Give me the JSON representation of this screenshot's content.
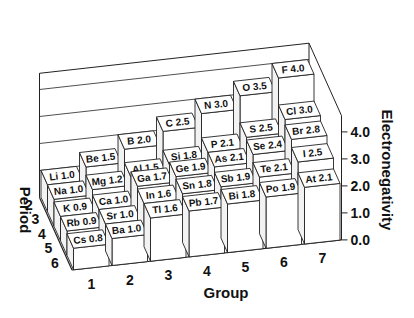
{
  "chart_data": {
    "type": "bar3d",
    "title": "",
    "xlabel": "Group",
    "ylabel": "Period",
    "zlabel": "Electronegativity",
    "x_categories": [
      "1",
      "2",
      "3",
      "4",
      "5",
      "6",
      "7"
    ],
    "y_categories": [
      "2",
      "3",
      "4",
      "5",
      "6"
    ],
    "z_ticks": [
      "0.0",
      "1.0",
      "2.0",
      "3.0",
      "4.0"
    ],
    "zlim": [
      0,
      4.0
    ],
    "grid": true,
    "elements": [
      {
        "symbol": "Li",
        "group": 1,
        "period": 2,
        "value": 1.0
      },
      {
        "symbol": "Na",
        "group": 1,
        "period": 3,
        "value": 1.0
      },
      {
        "symbol": "K",
        "group": 1,
        "period": 4,
        "value": 0.9
      },
      {
        "symbol": "Rb",
        "group": 1,
        "period": 5,
        "value": 0.9
      },
      {
        "symbol": "Cs",
        "group": 1,
        "period": 6,
        "value": 0.8
      },
      {
        "symbol": "Be",
        "group": 2,
        "period": 2,
        "value": 1.5
      },
      {
        "symbol": "Mg",
        "group": 2,
        "period": 3,
        "value": 1.2
      },
      {
        "symbol": "Ca",
        "group": 2,
        "period": 4,
        "value": 1.0
      },
      {
        "symbol": "Sr",
        "group": 2,
        "period": 5,
        "value": 1.0
      },
      {
        "symbol": "Ba",
        "group": 2,
        "period": 6,
        "value": 1.0
      },
      {
        "symbol": "B",
        "group": 3,
        "period": 2,
        "value": 2.0
      },
      {
        "symbol": "Al",
        "group": 3,
        "period": 3,
        "value": 1.5
      },
      {
        "symbol": "Ga",
        "group": 3,
        "period": 4,
        "value": 1.7
      },
      {
        "symbol": "In",
        "group": 3,
        "period": 5,
        "value": 1.6
      },
      {
        "symbol": "Tl",
        "group": 3,
        "period": 6,
        "value": 1.6
      },
      {
        "symbol": "C",
        "group": 4,
        "period": 2,
        "value": 2.5
      },
      {
        "symbol": "Si",
        "group": 4,
        "period": 3,
        "value": 1.8
      },
      {
        "symbol": "Ge",
        "group": 4,
        "period": 4,
        "value": 1.9
      },
      {
        "symbol": "Sn",
        "group": 4,
        "period": 5,
        "value": 1.8
      },
      {
        "symbol": "Pb",
        "group": 4,
        "period": 6,
        "value": 1.7
      },
      {
        "symbol": "N",
        "group": 5,
        "period": 2,
        "value": 3.0
      },
      {
        "symbol": "P",
        "group": 5,
        "period": 3,
        "value": 2.1
      },
      {
        "symbol": "As",
        "group": 5,
        "period": 4,
        "value": 2.1
      },
      {
        "symbol": "Sb",
        "group": 5,
        "period": 5,
        "value": 1.9
      },
      {
        "symbol": "Bi",
        "group": 5,
        "period": 6,
        "value": 1.8
      },
      {
        "symbol": "O",
        "group": 6,
        "period": 2,
        "value": 3.5
      },
      {
        "symbol": "S",
        "group": 6,
        "period": 3,
        "value": 2.5
      },
      {
        "symbol": "Se",
        "group": 6,
        "period": 4,
        "value": 2.4
      },
      {
        "symbol": "Te",
        "group": 6,
        "period": 5,
        "value": 2.1
      },
      {
        "symbol": "Po",
        "group": 6,
        "period": 6,
        "value": 1.9
      },
      {
        "symbol": "F",
        "group": 7,
        "period": 2,
        "value": 4.0
      },
      {
        "symbol": "Cl",
        "group": 7,
        "period": 3,
        "value": 3.0
      },
      {
        "symbol": "Br",
        "group": 7,
        "period": 4,
        "value": 2.8
      },
      {
        "symbol": "I",
        "group": 7,
        "period": 5,
        "value": 2.5
      },
      {
        "symbol": "At",
        "group": 7,
        "period": 6,
        "value": 2.1
      }
    ]
  },
  "colors": {
    "background": "#ffffff",
    "bar_face": "#ffffff",
    "bar_side": "#f2f2f2",
    "bar_top": "#ffffff",
    "line": "#222222",
    "text": "#111111"
  }
}
